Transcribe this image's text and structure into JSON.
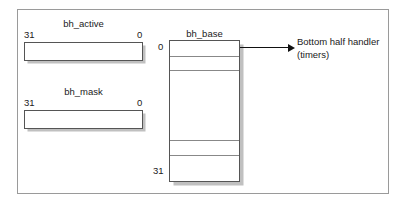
{
  "figure": {
    "caption_absent": true
  },
  "bh_active": {
    "title": "bh_active",
    "left_label": "31",
    "right_label": "0"
  },
  "bh_mask": {
    "title": "bh_mask",
    "left_label": "31",
    "right_label": "0"
  },
  "bh_base": {
    "title": "bh_base",
    "top_index_label": "0",
    "bottom_index_label": "31",
    "rows": [
      {
        "index": "0",
        "value": ""
      },
      {
        "index": "1",
        "value": ""
      },
      {
        "index": "2",
        "value": ""
      },
      {
        "index": "…",
        "value": ""
      },
      {
        "index": "30",
        "value": ""
      },
      {
        "index": "31",
        "value": ""
      }
    ]
  },
  "annotation": {
    "line1": "Bottom half handler",
    "line2": "(timers)"
  }
}
